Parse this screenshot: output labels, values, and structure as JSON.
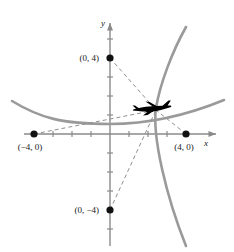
{
  "figure": {
    "kind": "coordinate-plane-diagram",
    "width": 234,
    "height": 252,
    "background": "#ffffff"
  },
  "axes": {
    "x_label": "x",
    "y_label": "y",
    "axis_color": "#8a8a8a",
    "origin_px": [
      110,
      134
    ],
    "unit_px": 19,
    "x_range": [
      -5.6,
      6.2
    ],
    "y_range": [
      -5.9,
      6.0
    ],
    "x_ticks": [
      -3,
      -2,
      -1,
      1,
      2,
      3
    ],
    "y_ticks": [
      -5,
      -4,
      -3,
      -2,
      -1,
      1,
      2,
      3,
      5
    ],
    "tick_len_px": 4
  },
  "points": [
    {
      "id": "p-left",
      "label": "(−4, 0)",
      "x": -4,
      "y": 0,
      "label_dx": -4,
      "label_dy": 16,
      "anchor": "middle",
      "color": "#111111"
    },
    {
      "id": "p-right",
      "label": "(4, 0)",
      "x": 4,
      "y": 0,
      "label_dx": -2,
      "label_dy": 16,
      "anchor": "middle",
      "color": "#111111"
    },
    {
      "id": "p-top",
      "label": "(0, 4)",
      "x": 0,
      "y": 4,
      "label_dx": -11,
      "label_dy": 3,
      "anchor": "end",
      "color": "#111111"
    },
    {
      "id": "p-bottom",
      "label": "(0, −4)",
      "x": 0,
      "y": -4,
      "label_dx": -11,
      "label_dy": 3,
      "anchor": "end",
      "color": "#111111"
    }
  ],
  "curves": {
    "color": "#9a9a9a",
    "width": 2.6,
    "parabola": {
      "type": "parabola",
      "description": "wide upward-opening parabola, vertex just below origin",
      "equation_hint": "y = x^2/16 - 0.55"
    },
    "hyperbola_branch": {
      "type": "hyperbola-branch",
      "description": "rightward-opening branch, vertex at the aircraft marker",
      "equation_hint": "x = 2.35 + 0.10*(y-1.35)^2 opening right, drawn downward-left"
    }
  },
  "dashed_lines": {
    "color": "#8f8f8f",
    "width": 1,
    "dash": "4 3",
    "segments": [
      {
        "id": "from-top",
        "from_point": "p-top",
        "to": "aircraft"
      },
      {
        "id": "from-bottom",
        "from_point": "p-bottom",
        "to": "aircraft"
      },
      {
        "id": "from-left",
        "from_point": "p-left",
        "to": "aircraft"
      },
      {
        "id": "from-right",
        "from_point": "p-right",
        "to": "aircraft"
      }
    ]
  },
  "aircraft": {
    "name": "airplane-marker",
    "center_px": [
      155,
      108
    ],
    "heading": "right",
    "color": "#000000",
    "length_px": 30
  }
}
